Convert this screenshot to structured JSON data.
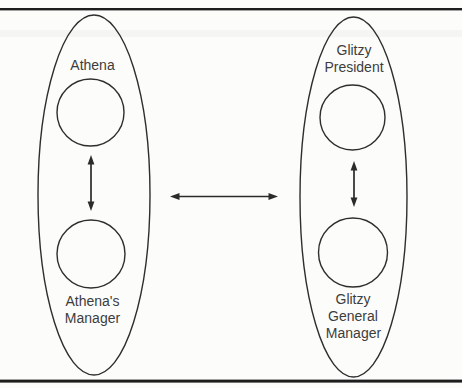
{
  "figure": {
    "type": "relationship-diagram",
    "left_oval": {
      "top_label_lines": [
        "Athena"
      ],
      "bottom_label_lines": [
        "Athena's",
        "Manager"
      ]
    },
    "right_oval": {
      "top_label_lines": [
        "Glitzy",
        "President"
      ],
      "bottom_label_lines": [
        "Glitzy",
        "General",
        "Manager"
      ]
    },
    "colors": {
      "background": "#fcfcfa",
      "line": "#2e2e2e",
      "text": "#3d3d3d",
      "rule": "#1d1d1d"
    }
  }
}
